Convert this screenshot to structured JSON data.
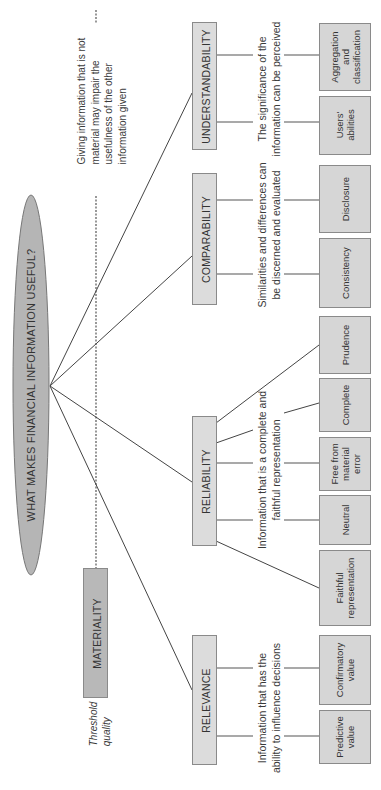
{
  "title": "WHAT MAKES FINANCIAL INFORMATION USEFUL?",
  "threshold": {
    "box_label": "MATERIALITY",
    "caption_line1": "Threshold",
    "caption_line2": "quality",
    "note_lines": [
      "Giving information that is not",
      "material may impair the",
      "usefulness of the other",
      "information given"
    ]
  },
  "categories": [
    {
      "label": "UNDERSTANDABILITY",
      "description": [
        "The significance of the",
        "information can be perceived"
      ],
      "leaves": [
        [
          "Aggregation",
          "and",
          "classification"
        ],
        [
          "Users'",
          "abilities"
        ]
      ]
    },
    {
      "label": "COMPARABILITY",
      "description": [
        "Similarities and differences can",
        "be discerned and evaluated"
      ],
      "leaves": [
        [
          "Disclosure"
        ],
        [
          "Consistency"
        ]
      ]
    },
    {
      "label": "RELIABILITY",
      "description": [
        "Information that is a complete and",
        "faithful representation"
      ],
      "leaves": [
        [
          "Prudence"
        ],
        [
          "Complete"
        ],
        [
          "Free from",
          "material",
          "error"
        ],
        [
          "Neutral"
        ],
        [
          "Faithful",
          "representation"
        ]
      ]
    },
    {
      "label": "RELEVANCE",
      "description": [
        "Information that has the",
        "ability to influence decisions"
      ],
      "leaves": [
        [
          "Confirmatory",
          "value"
        ],
        [
          "Predictive",
          "value"
        ]
      ]
    }
  ],
  "colors": {
    "ellipse": "#b5b5b5",
    "category_box": "#dcdcdc",
    "materiality_box": "#b8b8b8",
    "leaf_box": "#d6d6d6",
    "line": "#444444"
  }
}
